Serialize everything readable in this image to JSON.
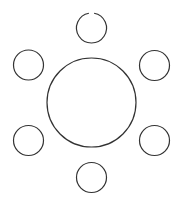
{
  "diagram": {
    "type": "round-table-seating",
    "background": "#ffffff",
    "stroke_color": "#333333",
    "table": {
      "cx": 91.5,
      "cy": 102.5,
      "r": 44.5
    },
    "seats": [
      {
        "name": "top",
        "cx": 91.5,
        "cy": 28,
        "r": 15,
        "gap_at_top": true
      },
      {
        "name": "upper-left",
        "cx": 28.5,
        "cy": 65,
        "r": 15
      },
      {
        "name": "upper-right",
        "cx": 154.5,
        "cy": 65.5,
        "r": 15
      },
      {
        "name": "lower-left",
        "cx": 28.5,
        "cy": 140.5,
        "r": 15
      },
      {
        "name": "lower-right",
        "cx": 154.5,
        "cy": 140.5,
        "r": 15
      },
      {
        "name": "bottom",
        "cx": 91.5,
        "cy": 177.5,
        "r": 15
      }
    ]
  }
}
